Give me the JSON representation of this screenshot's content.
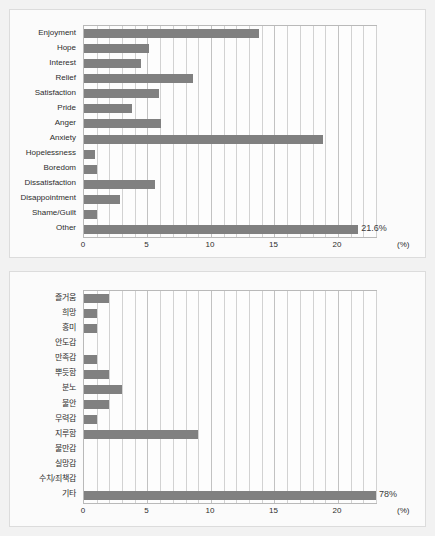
{
  "page": {
    "background_color": "#f2f2f2",
    "panel_background": "#fbfbfb",
    "bar_color": "#808080",
    "grid_color": "#d2d2d2"
  },
  "chart_data": [
    {
      "id": "emotions-en",
      "type": "bar",
      "orientation": "horizontal",
      "title": "",
      "xlabel": "(%)",
      "ylabel": "",
      "unit": "(%)",
      "xlim": [
        0,
        23
      ],
      "xticks": [
        0,
        5,
        10,
        15,
        20
      ],
      "xtick_labels": [
        "0",
        "5",
        "10",
        "15",
        "20"
      ],
      "grid": true,
      "legend": "none",
      "categories": [
        "Enjoyment",
        "Hope",
        "Interest",
        "Relief",
        "Satisfaction",
        "Pride",
        "Anger",
        "Anxiety",
        "Hopelessness",
        "Boredom",
        "Dissatisfaction",
        "Disappointment",
        "Shame/Guilt",
        "Other"
      ],
      "values": [
        13.8,
        5.1,
        4.5,
        8.6,
        5.9,
        3.8,
        6.1,
        18.8,
        0.9,
        1.0,
        5.6,
        2.8,
        1.0,
        21.6
      ],
      "annotations": [
        {
          "category": "Other",
          "text": "21.6%"
        }
      ]
    },
    {
      "id": "emotions-kr",
      "type": "bar",
      "orientation": "horizontal",
      "title": "",
      "xlabel": "(%)",
      "ylabel": "",
      "unit": "(%)",
      "xlim": [
        0,
        23
      ],
      "xticks": [
        0,
        5,
        10,
        15,
        20
      ],
      "xtick_labels": [
        "0",
        "5",
        "10",
        "15",
        "20"
      ],
      "grid": true,
      "legend": "none",
      "categories": [
        "즐거움",
        "희망",
        "흥미",
        "안도감",
        "만족감",
        "뿌듯함",
        "분노",
        "불안",
        "무력감",
        "지루함",
        "불만감",
        "실망감",
        "수치/죄책감",
        "기타"
      ],
      "values": [
        2.0,
        1.0,
        1.0,
        0.0,
        1.0,
        2.0,
        3.0,
        2.0,
        1.0,
        9.0,
        0.0,
        0.0,
        0.0,
        23.0
      ],
      "annotations": [
        {
          "category": "기타",
          "text": "78%"
        }
      ]
    }
  ]
}
